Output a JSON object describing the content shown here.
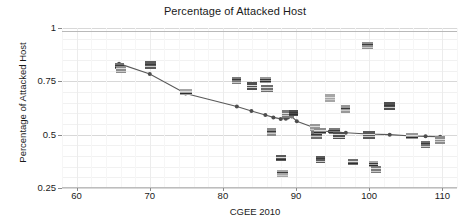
{
  "chart_data": {
    "type": "scatter",
    "title": "Percentage of Attacked Host",
    "xlabel": "CGEE 2010",
    "ylabel": "Percentage of Attacked Host",
    "xlim": [
      58,
      112
    ],
    "ylim": [
      0.25,
      1.0
    ],
    "xticks": [
      60,
      70,
      80,
      90,
      100,
      110
    ],
    "yticks": [
      0.25,
      0.5,
      0.75,
      1
    ],
    "ytick_labels": [
      "0.25",
      "0.5",
      "0.75",
      "1"
    ],
    "xtick_labels": [
      "60",
      "70",
      "80",
      "90",
      "100",
      "110"
    ],
    "grid": true,
    "legend": "none",
    "marker_style": "country-flag-icon",
    "series": [
      {
        "name": "Countries (flag markers)",
        "points": [
          {
            "x": 65.8,
            "y": 0.822
          },
          {
            "x": 66.0,
            "y": 0.805
          },
          {
            "x": 70.1,
            "y": 0.828
          },
          {
            "x": 74.9,
            "y": 0.7
          },
          {
            "x": 81.9,
            "y": 0.752
          },
          {
            "x": 83.9,
            "y": 0.727
          },
          {
            "x": 85.8,
            "y": 0.757
          },
          {
            "x": 86.0,
            "y": 0.718
          },
          {
            "x": 86.7,
            "y": 0.515
          },
          {
            "x": 87.9,
            "y": 0.392
          },
          {
            "x": 88.2,
            "y": 0.318
          },
          {
            "x": 88.9,
            "y": 0.598
          },
          {
            "x": 89.6,
            "y": 0.6
          },
          {
            "x": 92.6,
            "y": 0.535
          },
          {
            "x": 92.8,
            "y": 0.5
          },
          {
            "x": 93.2,
            "y": 0.516
          },
          {
            "x": 93.4,
            "y": 0.383
          },
          {
            "x": 94.6,
            "y": 0.672
          },
          {
            "x": 95.3,
            "y": 0.516
          },
          {
            "x": 95.8,
            "y": 0.497
          },
          {
            "x": 96.8,
            "y": 0.622
          },
          {
            "x": 97.8,
            "y": 0.372
          },
          {
            "x": 99.8,
            "y": 0.92
          },
          {
            "x": 99.9,
            "y": 0.498
          },
          {
            "x": 100.6,
            "y": 0.363
          },
          {
            "x": 100.9,
            "y": 0.335
          },
          {
            "x": 102.8,
            "y": 0.636
          },
          {
            "x": 105.8,
            "y": 0.492
          },
          {
            "x": 107.7,
            "y": 0.452
          },
          {
            "x": 109.7,
            "y": 0.477
          }
        ]
      },
      {
        "name": "Trend line",
        "points": [
          {
            "x": 65.8,
            "y": 0.833
          },
          {
            "x": 70.0,
            "y": 0.784
          },
          {
            "x": 74.9,
            "y": 0.693
          },
          {
            "x": 81.9,
            "y": 0.632
          },
          {
            "x": 83.9,
            "y": 0.611
          },
          {
            "x": 85.8,
            "y": 0.592
          },
          {
            "x": 86.9,
            "y": 0.581
          },
          {
            "x": 87.9,
            "y": 0.574
          },
          {
            "x": 88.6,
            "y": 0.575
          },
          {
            "x": 88.9,
            "y": 0.58
          },
          {
            "x": 89.4,
            "y": 0.585
          },
          {
            "x": 90.1,
            "y": 0.563
          },
          {
            "x": 92.6,
            "y": 0.531
          },
          {
            "x": 93.4,
            "y": 0.517
          },
          {
            "x": 94.6,
            "y": 0.515
          },
          {
            "x": 95.6,
            "y": 0.512
          },
          {
            "x": 96.8,
            "y": 0.509
          },
          {
            "x": 99.8,
            "y": 0.503
          },
          {
            "x": 102.8,
            "y": 0.5
          },
          {
            "x": 105.8,
            "y": 0.494
          },
          {
            "x": 107.7,
            "y": 0.492
          },
          {
            "x": 109.7,
            "y": 0.49
          }
        ]
      }
    ],
    "annotations": [
      {
        "text": "outlier near x=100, y=0.92",
        "x": 99.8,
        "y": 0.92
      }
    ]
  },
  "colors": {
    "line": "#5a5a5a",
    "marker": "#6f6f6f",
    "grid_major": "#d8d8d8",
    "grid_minor": "#f1f1f1",
    "text": "#1a1a1a",
    "background": "#ffffff"
  }
}
